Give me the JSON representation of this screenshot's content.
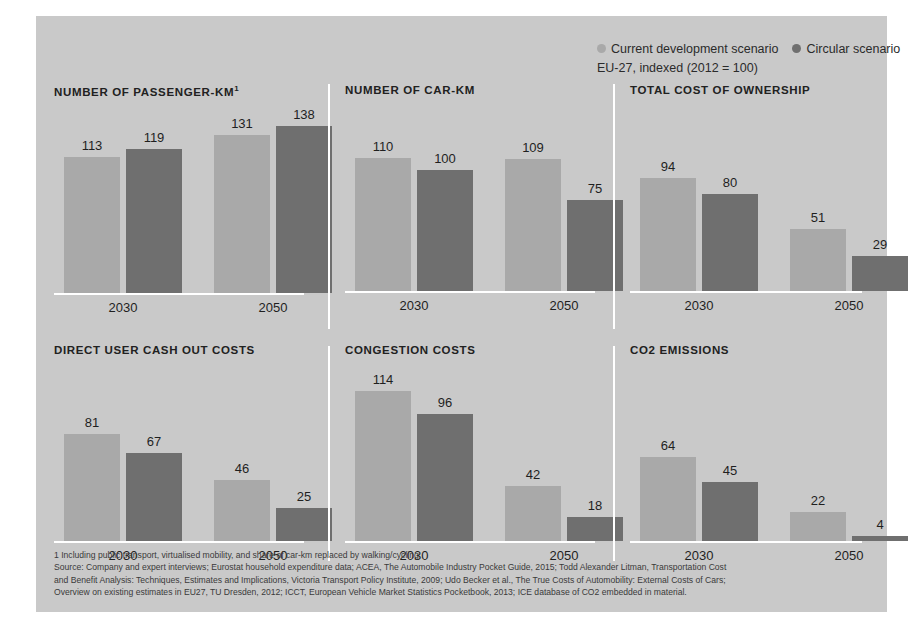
{
  "legend": {
    "series": [
      {
        "label": "Current development scenario",
        "color": "#a9a9a9",
        "key": "current"
      },
      {
        "label": "Circular scenario",
        "color": "#6f6f6f",
        "key": "circular"
      }
    ],
    "subtitle": "EU-27, indexed (2012 = 100)"
  },
  "colors": {
    "panel_background": "#c9c9c9",
    "page_background": "#ffffff",
    "light_bar": "#a9a9a9",
    "dark_bar": "#6f6f6f",
    "baseline": "#ffffff",
    "text": "#1f1f1f"
  },
  "footnote": {
    "line1": "1 Including public transport, virtualised mobility, and share of car-km replaced by walking/cycling",
    "line2": "Source: Company and expert interviews; Eurostat household expenditure data; ACEA, The Automobile Industry Pocket Guide, 2015; Todd Alexander Litman, Transportation Cost",
    "line3": "and Benefit Analysis: Techniques, Estimates and Implications, Victoria Transport Policy Institute, 2009; Udo Becker et al., The True Costs of Automobility: External Costs of Cars;",
    "line4": "Overview on existing estimates in EU27, TU Dresden, 2012; ICCT, European Vehicle Market Statistics Pocketbook, 2013; ICE database of CO2 embedded in material."
  },
  "chart_data": [
    {
      "type": "bar",
      "title": "NUMBER OF PASSENGER-KM",
      "title_superscript": "1",
      "categories": [
        "2030",
        "2050"
      ],
      "series": [
        {
          "name": "Current development scenario",
          "values": [
            113,
            119
          ]
        },
        {
          "name": "Circular scenario",
          "values": [
            131,
            138
          ]
        }
      ],
      "groups": [
        {
          "category": "2030",
          "values": [
            113,
            119
          ]
        },
        {
          "category": "2050",
          "values": [
            131,
            138
          ]
        }
      ],
      "ylim": [
        0,
        145
      ],
      "ylabel": "",
      "xlabel": "",
      "grid": false
    },
    {
      "type": "bar",
      "title": "NUMBER OF CAR-KM",
      "title_superscript": "",
      "categories": [
        "2030",
        "2050"
      ],
      "groups": [
        {
          "category": "2030",
          "values": [
            110,
            100
          ]
        },
        {
          "category": "2050",
          "values": [
            109,
            75
          ]
        }
      ],
      "ylim": [
        0,
        145
      ],
      "ylabel": "",
      "xlabel": "",
      "grid": false
    },
    {
      "type": "bar",
      "title": "TOTAL COST OF OWNERSHIP",
      "title_superscript": "",
      "categories": [
        "2030",
        "2050"
      ],
      "groups": [
        {
          "category": "2030",
          "values": [
            94,
            80
          ]
        },
        {
          "category": "2050",
          "values": [
            51,
            29
          ]
        }
      ],
      "ylim": [
        0,
        145
      ],
      "ylabel": "",
      "xlabel": "",
      "grid": false
    },
    {
      "type": "bar",
      "title": "DIRECT USER CASH OUT COSTS",
      "title_superscript": "",
      "categories": [
        "2030",
        "2050"
      ],
      "groups": [
        {
          "category": "2030",
          "values": [
            81,
            67
          ]
        },
        {
          "category": "2050",
          "values": [
            46,
            25
          ]
        }
      ],
      "ylim": [
        0,
        125
      ],
      "ylabel": "",
      "xlabel": "",
      "grid": false
    },
    {
      "type": "bar",
      "title": "CONGESTION COSTS",
      "title_superscript": "",
      "categories": [
        "2030",
        "2050"
      ],
      "groups": [
        {
          "category": "2030",
          "values": [
            114,
            96
          ]
        },
        {
          "category": "2050",
          "values": [
            42,
            18
          ]
        }
      ],
      "ylim": [
        0,
        125
      ],
      "ylabel": "",
      "xlabel": "",
      "grid": false
    },
    {
      "type": "bar",
      "title": "CO2 EMISSIONS",
      "title_superscript": "",
      "categories": [
        "2030",
        "2050"
      ],
      "groups": [
        {
          "category": "2030",
          "values": [
            64,
            45
          ]
        },
        {
          "category": "2050",
          "values": [
            22,
            4
          ]
        }
      ],
      "ylim": [
        0,
        125
      ],
      "ylabel": "",
      "xlabel": "",
      "grid": false
    }
  ]
}
